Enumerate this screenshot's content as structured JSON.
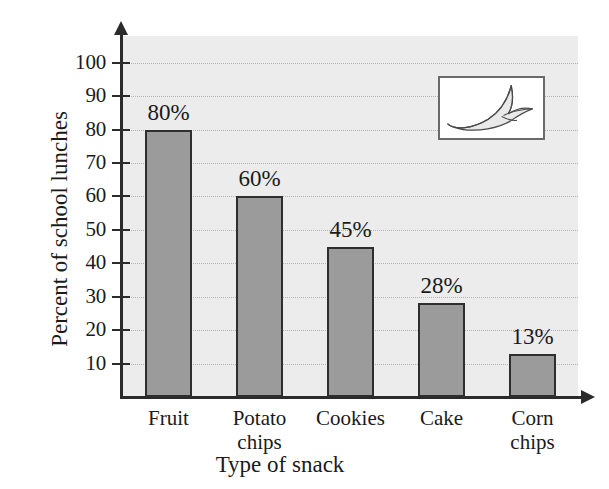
{
  "chart_data": {
    "type": "bar",
    "title": "",
    "subtitle": "",
    "xlabel": "Type of snack",
    "ylabel": "Percent of school lunches",
    "categories": [
      "Fruit",
      "Potato chips",
      "Cookies",
      "Cake",
      "Corn chips"
    ],
    "category_lines": [
      [
        "Fruit"
      ],
      [
        "Potato",
        "chips"
      ],
      [
        "Cookies"
      ],
      [
        "Cake"
      ],
      [
        "Corn",
        "chips"
      ]
    ],
    "values": [
      80,
      60,
      45,
      28,
      13
    ],
    "value_labels": [
      "80%",
      "60%",
      "45%",
      "28%",
      "13%"
    ],
    "ylim": [
      0,
      108
    ],
    "y_ticks": [
      10,
      20,
      30,
      40,
      50,
      60,
      70,
      80,
      90,
      100
    ],
    "y_tick_labels": [
      "10",
      "20",
      "30",
      "40",
      "50",
      "60",
      "70",
      "80",
      "90",
      "100"
    ],
    "grid": true,
    "grid_axis": "y",
    "legend": "none",
    "bar_color": "#9b9b9b",
    "bar_border_color": "#2e2e2e",
    "plot_background": "#ececed",
    "gridline_color": "#b4b4b6",
    "axis_color": "#2b2b2b"
  },
  "inset": {
    "name": "banana-illustration",
    "description": "Peeled banana drawing",
    "border_color": "#6a6a6c",
    "background": "#ffffff",
    "fill_color": "#e9e9ea",
    "stroke_color": "#4a4a4c"
  }
}
